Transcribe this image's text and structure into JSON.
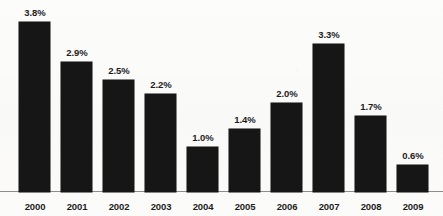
{
  "chart_data": {
    "type": "bar",
    "title": "",
    "subtitle": "",
    "xlabel": "",
    "ylabel": "",
    "categories": [
      "2000",
      "2001",
      "2002",
      "2003",
      "2004",
      "2005",
      "2006",
      "2007",
      "2008",
      "2009"
    ],
    "values": [
      3.8,
      2.9,
      2.5,
      2.2,
      1.0,
      1.4,
      2.0,
      3.3,
      1.7,
      0.6
    ],
    "data_labels": [
      "3.8%",
      "2.9%",
      "2.5%",
      "2.2%",
      "1.0%",
      "1.4%",
      "2.0%",
      "3.3%",
      "1.7%",
      "0.6%"
    ],
    "ylim": [
      0,
      3.8
    ],
    "grid": false,
    "legend": null,
    "legend_position": "none",
    "bar_color": "#161616",
    "axis_color": "#8d8d8d",
    "background_color": "#fbfbfa",
    "label_color": "#1d1d1d",
    "units": "percent",
    "annotations": []
  }
}
